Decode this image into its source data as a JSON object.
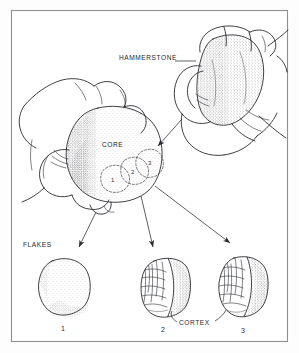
{
  "figure": {
    "frame_color": "#8d8e92",
    "ink_color": "#1e1f23",
    "paper_color": "#ffffff"
  },
  "labels": {
    "hammerstone": "HAMMERSTONE",
    "core": "CORE",
    "flakes": "FLAKES",
    "cortex": "CORTEX"
  },
  "core_scars": [
    {
      "id": "scar-1",
      "label": "1"
    },
    {
      "id": "scar-2",
      "label": "2"
    },
    {
      "id": "scar-3",
      "label": "3"
    }
  ],
  "flakes": [
    {
      "id": "flake-1",
      "label": "1"
    },
    {
      "id": "flake-2",
      "label": "2"
    },
    {
      "id": "flake-3",
      "label": "3"
    }
  ],
  "icons": {
    "arrow_hammer_to_core": "arrow-down-left-icon",
    "arrow_core_to_flake_1": "arrow-down-left-icon",
    "arrow_core_to_flake_2": "arrow-down-icon",
    "arrow_core_to_flake_3": "arrow-down-right-icon",
    "leader_hammerstone": "leader-line-icon",
    "leader_cortex_left": "leader-line-icon",
    "leader_cortex_right": "leader-line-icon"
  }
}
